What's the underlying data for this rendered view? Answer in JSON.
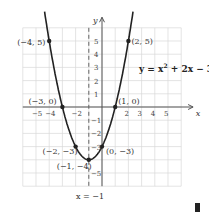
{
  "chart_data": {
    "type": "line",
    "title": "",
    "equation_label": "y = x² + 2x − 3",
    "function": "y = x^2 + 2x - 3",
    "xlabel": "x",
    "ylabel": "y",
    "xlim": [
      -6,
      6
    ],
    "ylim": [
      -6,
      6
    ],
    "grid": true,
    "x_tick_labels": [
      "−5",
      "−4",
      "−2",
      "2",
      "3",
      "4",
      "5"
    ],
    "y_tick_labels": [
      "5",
      "4",
      "3",
      "2",
      "1",
      "−1",
      "−2",
      "−3",
      "−5"
    ],
    "axis_of_symmetry": {
      "x": -1,
      "label": "x = −1",
      "style": "dashed"
    },
    "points": [
      {
        "x": -4,
        "y": 5,
        "label": "(−4, 5)"
      },
      {
        "x": 2,
        "y": 5,
        "label": "(2, 5)"
      },
      {
        "x": -3,
        "y": 0,
        "label": "(−3, 0)"
      },
      {
        "x": 1,
        "y": 0,
        "label": "(1, 0)"
      },
      {
        "x": -2,
        "y": -3,
        "label": "(−2, −3)"
      },
      {
        "x": 0,
        "y": -3,
        "label": "(0, −3)"
      },
      {
        "x": -1,
        "y": -4,
        "label": "(−1, −4)"
      }
    ],
    "vertex": {
      "x": -1,
      "y": -4
    }
  },
  "colors": {
    "curve": "#222222",
    "grid": "#d9d9d9",
    "axes": "#555555"
  }
}
